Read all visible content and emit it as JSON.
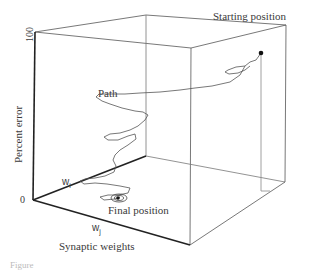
{
  "figure": {
    "y_axis": {
      "label": "Percent error",
      "tick_top": "100",
      "tick_bottom": "0"
    },
    "x_axis": {
      "label": "Synaptic weights",
      "axis_i": "w",
      "axis_i_sub": "i",
      "axis_j": "w",
      "axis_j_sub": "j"
    },
    "annotations": {
      "start": "Starting position",
      "path": "Path",
      "final": "Final position"
    },
    "caption_partial": "Figure"
  }
}
